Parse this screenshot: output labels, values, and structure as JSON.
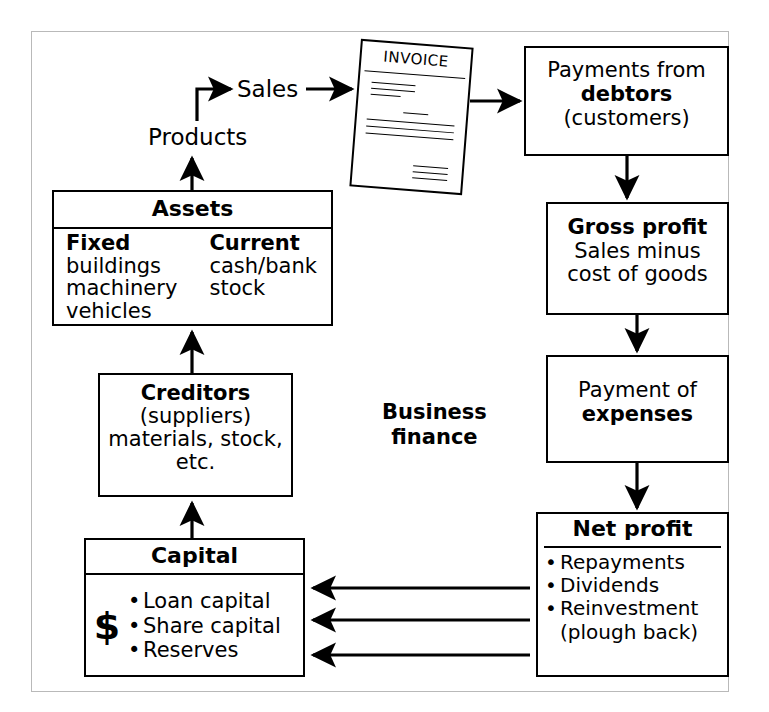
{
  "diagram": {
    "title": "Business finance",
    "center_label_line1": "Business",
    "center_label_line2": "finance",
    "colors": {
      "frame_border": "#b9b9b9",
      "box_border": "#000000",
      "background": "#ffffff",
      "text": "#000000"
    }
  },
  "labels": {
    "sales": "Sales",
    "products": "Products"
  },
  "invoice": {
    "title": "INVOICE"
  },
  "boxes": {
    "assets": {
      "header": "Assets",
      "columns": [
        {
          "title": "Fixed",
          "items": [
            "buildings",
            "machinery",
            "vehicles"
          ]
        },
        {
          "title": "Current",
          "items": [
            "cash/bank",
            "stock"
          ]
        }
      ]
    },
    "creditors": {
      "line1": "Creditors",
      "line2": "(suppliers)",
      "line3": "materials, stock,",
      "line4": "etc."
    },
    "capital": {
      "header": "Capital",
      "currency_symbol": "$",
      "items": [
        "Loan capital",
        "Share capital",
        "Reserves"
      ]
    },
    "payments": {
      "line1": "Payments from",
      "line2": "debtors",
      "line3": "(customers)"
    },
    "gross_profit": {
      "line1": "Gross profit",
      "line2": "Sales minus",
      "line3": "cost of goods"
    },
    "expenses": {
      "line1": "Payment of",
      "line2": "expenses"
    },
    "net_profit": {
      "header": "Net profit",
      "items": [
        "Repayments",
        "Dividends",
        "Reinvestment"
      ],
      "item3_continuation": "(plough back)"
    }
  }
}
